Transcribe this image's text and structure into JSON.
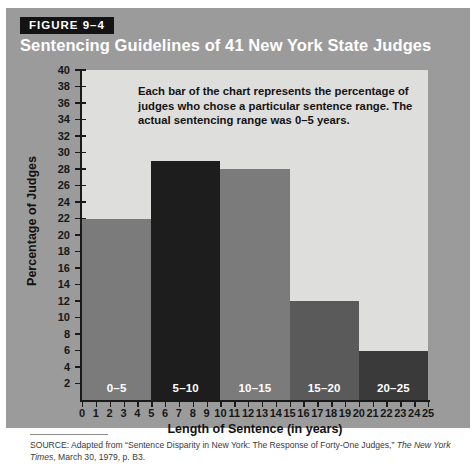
{
  "figure": {
    "tag": "FIGURE 9–4",
    "title": "Sentencing Guidelines of 41 New York State Judges",
    "annotation": "Each bar of the chart represents the percentage of judges who chose a particular sentence range. The actual sentencing range was 0–5 years.",
    "source_prefix": "SOURCE: Adapted from “Sentence Disparity in New York: The Response of Forty-One Judges,” ",
    "source_italic": "The New York Times",
    "source_suffix": ", March 30, 1979, p. B3."
  },
  "colors": {
    "figure_background": "#9b9b9b",
    "tag_background": "#131313",
    "tag_text": "#ffffff",
    "title_text": "#ffffff",
    "plot_background": "#dededc",
    "axis": "#1a1a1a",
    "bar_medium": "#7b7b7b",
    "bar_dark": "#5a5a5a",
    "bar_black": "#1d1d1d",
    "bar_label_text": "#ffffff",
    "page_background": "#ffffff"
  },
  "chart_data": {
    "type": "bar",
    "title": "Sentencing Guidelines of 41 New York State Judges",
    "xlabel": "Length of Sentence (in years)",
    "ylabel": "Percentage of Judges",
    "categories": [
      "0–5",
      "5–10",
      "10–15",
      "15–20",
      "20–25"
    ],
    "values": [
      22,
      29,
      28,
      12,
      6
    ],
    "bin_edges": [
      0,
      5,
      10,
      15,
      20,
      25
    ],
    "bar_colors": [
      "#7b7b7b",
      "#1d1d1d",
      "#7b7b7b",
      "#5a5a5a",
      "#3a3a3a"
    ],
    "xlim": [
      0,
      25
    ],
    "ylim": [
      0,
      40
    ],
    "ytick_labels": [
      "40",
      "38",
      "36",
      "34",
      "32",
      "30",
      "28",
      "26",
      "24",
      "22",
      "20",
      "18",
      "16",
      "14",
      "12",
      "10",
      "8",
      "6",
      "4",
      "2"
    ],
    "ytick_values": [
      40,
      38,
      36,
      34,
      32,
      30,
      28,
      26,
      24,
      22,
      20,
      18,
      16,
      14,
      12,
      10,
      8,
      6,
      4,
      2
    ],
    "xtick_labels": [
      "0",
      "1",
      "2",
      "3",
      "4",
      "5",
      "6",
      "7",
      "8",
      "9",
      "10",
      "11",
      "12",
      "13",
      "14",
      "15",
      "16",
      "17",
      "18",
      "19",
      "20",
      "21",
      "22",
      "23",
      "24",
      "25"
    ],
    "xtick_values": [
      0,
      1,
      2,
      3,
      4,
      5,
      6,
      7,
      8,
      9,
      10,
      11,
      12,
      13,
      14,
      15,
      16,
      17,
      18,
      19,
      20,
      21,
      22,
      23,
      24,
      25
    ],
    "grid": false,
    "legend": false,
    "annotation": "Each bar of the chart represents the percentage of judges who chose a particular sentence range. The actual sentencing range was 0–5 years."
  }
}
